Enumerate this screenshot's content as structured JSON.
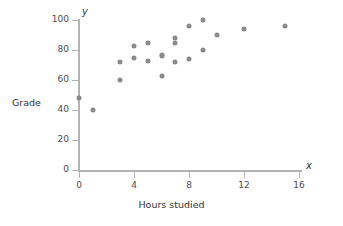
{
  "chart_data": {
    "type": "scatter",
    "title": "",
    "xlabel": "Hours studied",
    "ylabel": "Grade",
    "x_symbol": "x",
    "y_symbol": "y",
    "xlim": [
      0,
      16
    ],
    "ylim": [
      0,
      100
    ],
    "xticks": [
      0,
      4,
      8,
      12,
      16
    ],
    "yticks": [
      0,
      20,
      40,
      60,
      80,
      100
    ],
    "xtick_labels": [
      "0",
      "4",
      "8",
      "12",
      "16"
    ],
    "ytick_labels": [
      "0",
      "20",
      "40",
      "60",
      "80",
      "100"
    ],
    "grid": false,
    "legend": null,
    "point_color": "#8a8a8a",
    "axis_color": "#b3b3b3",
    "series": [
      {
        "name": "Students",
        "points": [
          {
            "x": 0,
            "y": 48
          },
          {
            "x": 1,
            "y": 40
          },
          {
            "x": 3,
            "y": 72
          },
          {
            "x": 3,
            "y": 60
          },
          {
            "x": 4,
            "y": 83
          },
          {
            "x": 4,
            "y": 75
          },
          {
            "x": 5,
            "y": 85
          },
          {
            "x": 5,
            "y": 73
          },
          {
            "x": 6,
            "y": 77
          },
          {
            "x": 6,
            "y": 76
          },
          {
            "x": 6,
            "y": 63
          },
          {
            "x": 7,
            "y": 88
          },
          {
            "x": 7,
            "y": 85
          },
          {
            "x": 7,
            "y": 72
          },
          {
            "x": 8,
            "y": 96
          },
          {
            "x": 8,
            "y": 74
          },
          {
            "x": 9,
            "y": 100
          },
          {
            "x": 9,
            "y": 80
          },
          {
            "x": 10,
            "y": 90
          },
          {
            "x": 12,
            "y": 94
          },
          {
            "x": 15,
            "y": 96
          }
        ]
      }
    ]
  }
}
